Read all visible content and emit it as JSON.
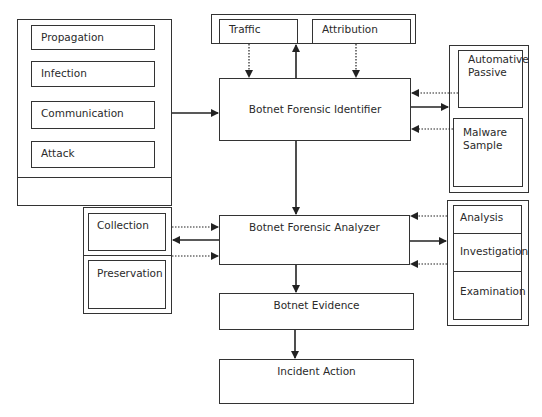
{
  "diagram": {
    "stages": {
      "title": "Botnet lifecycle stages",
      "items": [
        "Propagation",
        "Infection",
        "Communication",
        "Attack"
      ]
    },
    "sources": {
      "items": [
        "Traffic",
        "Attribution"
      ]
    },
    "identifier": {
      "label": "Botnet Forensic Identifier"
    },
    "detection": {
      "items": [
        "Automative\nPassive",
        "Malware\nSample"
      ]
    },
    "analyzer": {
      "label": "Botnet Forensic Analyzer"
    },
    "handling": {
      "items": [
        "Collection",
        "Preservation"
      ]
    },
    "analysis": {
      "items": [
        "Analysis",
        "Investigation",
        "Examination"
      ]
    },
    "evidence": {
      "label": "Botnet Evidence"
    },
    "action": {
      "label": "Incident Action"
    }
  },
  "colors": {
    "line": "#333333",
    "background": "#ffffff",
    "text": "#2a2a2a"
  }
}
